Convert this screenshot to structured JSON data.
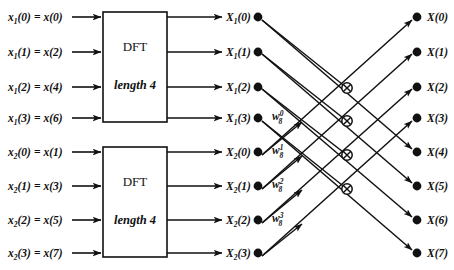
{
  "diagram": {
    "background_color": "#ffffff",
    "line_color": "#111111",
    "blocks": [
      {
        "id": "dft-top",
        "line1": "DFT",
        "line2": "length 4"
      },
      {
        "id": "dft-bottom",
        "line1": "DFT",
        "line2": "length 4"
      }
    ],
    "inputs": [
      {
        "base": "x",
        "sub": "1",
        "index": "(0)",
        "eq": "=",
        "rhs": "x(0)",
        "text": "x1(0) = x(0)"
      },
      {
        "base": "x",
        "sub": "1",
        "index": "(1)",
        "eq": "=",
        "rhs": "x(2)",
        "text": "x1(1) = x(2)"
      },
      {
        "base": "x",
        "sub": "1",
        "index": "(2)",
        "eq": "=",
        "rhs": "x(4)",
        "text": "x1(2) = x(4)"
      },
      {
        "base": "x",
        "sub": "1",
        "index": "(3)",
        "eq": "=",
        "rhs": "x(6)",
        "text": "x1(3) = x(6)"
      },
      {
        "base": "x",
        "sub": "2",
        "index": "(0)",
        "eq": "=",
        "rhs": "x(1)",
        "text": "x2(0) = x(1)"
      },
      {
        "base": "x",
        "sub": "2",
        "index": "(1)",
        "eq": "=",
        "rhs": "x(3)",
        "text": "x2(1) = x(3)"
      },
      {
        "base": "x",
        "sub": "2",
        "index": "(2)",
        "eq": "=",
        "rhs": "x(5)",
        "text": "x2(2) = x(5)"
      },
      {
        "base": "x",
        "sub": "2",
        "index": "(3)",
        "eq": "=",
        "rhs": "x(7)",
        "text": "x2(3) = x(7)"
      }
    ],
    "mid_outputs": [
      {
        "base": "X",
        "sub": "1",
        "index": "(0)",
        "text": "X1(0)"
      },
      {
        "base": "X",
        "sub": "1",
        "index": "(1)",
        "text": "X1(1)"
      },
      {
        "base": "X",
        "sub": "1",
        "index": "(2)",
        "text": "X1(2)"
      },
      {
        "base": "X",
        "sub": "1",
        "index": "(3)",
        "text": "X1(3)"
      },
      {
        "base": "X",
        "sub": "2",
        "index": "(0)",
        "text": "X2(0)"
      },
      {
        "base": "X",
        "sub": "2",
        "index": "(1)",
        "text": "X2(1)"
      },
      {
        "base": "X",
        "sub": "2",
        "index": "(2)",
        "text": "X2(2)"
      },
      {
        "base": "X",
        "sub": "2",
        "index": "(3)",
        "text": "X2(3)"
      }
    ],
    "twiddles": [
      {
        "base": "w",
        "sub": "8",
        "sup": "0",
        "text": "w8^0"
      },
      {
        "base": "w",
        "sub": "8",
        "sup": "1",
        "text": "w8^1"
      },
      {
        "base": "w",
        "sub": "8",
        "sup": "2",
        "text": "w8^2"
      },
      {
        "base": "w",
        "sub": "8",
        "sup": "3",
        "text": "w8^3"
      }
    ],
    "outputs": [
      {
        "base": "X",
        "index": "(0)",
        "text": "X(0)"
      },
      {
        "base": "X",
        "index": "(1)",
        "text": "X(1)"
      },
      {
        "base": "X",
        "index": "(2)",
        "text": "X(2)"
      },
      {
        "base": "X",
        "index": "(3)",
        "text": "X(3)"
      },
      {
        "base": "X",
        "index": "(4)",
        "text": "X(4)"
      },
      {
        "base": "X",
        "index": "(5)",
        "text": "X(5)"
      },
      {
        "base": "X",
        "index": "(6)",
        "text": "X(6)"
      },
      {
        "base": "X",
        "index": "(7)",
        "text": "X(7)"
      }
    ]
  }
}
